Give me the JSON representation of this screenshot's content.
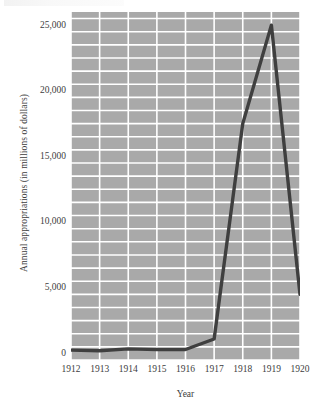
{
  "chart_data": {
    "type": "line",
    "title": "",
    "xlabel": "Year",
    "ylabel": "Annual appropriations (in millions of dollars)",
    "x": [
      1912,
      1913,
      1914,
      1915,
      1916,
      1917,
      1918,
      1919,
      1920
    ],
    "categories": [
      "1912",
      "1913",
      "1914",
      "1915",
      "1916",
      "1917",
      "1918",
      "1919",
      "1920"
    ],
    "values": [
      750,
      700,
      850,
      800,
      800,
      1600,
      18000,
      25500,
      5000
    ],
    "series": [
      {
        "name": "Annual appropriations",
        "values": [
          750,
          700,
          850,
          800,
          800,
          1600,
          18000,
          25500,
          5000
        ]
      }
    ],
    "xlim": [
      1912,
      1920
    ],
    "ylim": [
      0,
      26500
    ],
    "ytick_values": [
      0,
      5000,
      10000,
      15000,
      20000,
      25000
    ],
    "ytick_labels": [
      "0",
      "5,000",
      "10,000",
      "15,000",
      "20,000",
      "25,000"
    ],
    "xtick_labels": [
      "1912",
      "1913",
      "1914",
      "1915",
      "1916",
      "1917",
      "1918",
      "1919",
      "1920"
    ],
    "grid": true,
    "grid_color": "#ffffff",
    "plot_background": "#a9a9a9",
    "line_color": "#3f3f3f",
    "legend": null,
    "legend_position": "none",
    "minor_gridline_step": 1000
  },
  "axes": {
    "y_axis_title": "Annual appropriations (in millions of dollars)",
    "x_axis_title": "Year"
  }
}
